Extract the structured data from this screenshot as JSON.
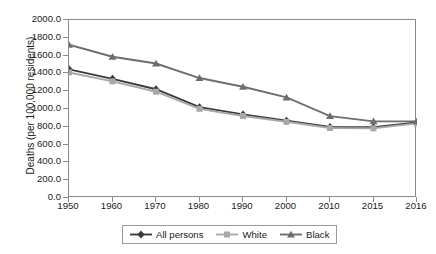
{
  "chart_data": {
    "type": "line",
    "title": "",
    "xlabel": "",
    "ylabel": "Deaths (per 100,000 residents)",
    "categories": [
      "1950",
      "1960",
      "1970",
      "1980",
      "1990",
      "2000",
      "2010",
      "2015",
      "2016"
    ],
    "ylim": [
      0,
      2000
    ],
    "ytick_step": 200,
    "yticks": [
      "2000.0",
      "1800.0",
      "1600.0",
      "1400.0",
      "1200.0",
      "1000.0",
      "800.0",
      "600.0",
      "400.0",
      "200.0",
      "0.0"
    ],
    "grid": false,
    "legend_position": "bottom",
    "series": [
      {
        "name": "All persons",
        "marker": "diamond",
        "color": "#3a3a3a",
        "values": [
          1446,
          1339,
          1222,
          1021,
          939,
          869,
          799,
          795,
          849
        ]
      },
      {
        "name": "White",
        "marker": "square",
        "color": "#a8a8a8",
        "values": [
          1411,
          1311,
          1194,
          1002,
          921,
          856,
          786,
          783,
          839
        ]
      },
      {
        "name": "Black",
        "marker": "triangle",
        "color": "#6e6e6e",
        "values": [
          1722,
          1587,
          1511,
          1348,
          1250,
          1130,
          920,
          861,
          861
        ]
      }
    ]
  },
  "legend": {
    "items": [
      {
        "label": "All persons"
      },
      {
        "label": "White"
      },
      {
        "label": "Black"
      }
    ]
  }
}
